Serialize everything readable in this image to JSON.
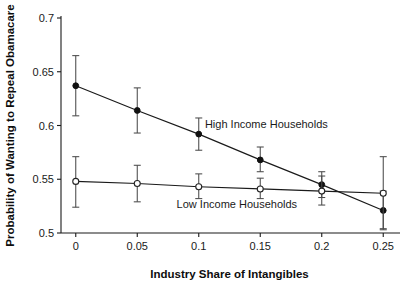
{
  "chart_data": {
    "type": "scatter",
    "title": "",
    "xlabel": "Industry Share of Intangibles",
    "ylabel": "Probability of Wanting to Repeal Obamacare",
    "x": [
      0,
      0.05,
      0.1,
      0.15,
      0.2,
      0.25
    ],
    "xlim": [
      -0.012,
      0.262
    ],
    "ylim": [
      0.5,
      0.7
    ],
    "xticks": [
      0,
      0.05,
      0.1,
      0.15,
      0.2,
      0.25
    ],
    "xtick_labels": [
      "0",
      "0.05",
      "0.1",
      "0.15",
      "0.2",
      "0.25"
    ],
    "yticks": [
      0.5,
      0.55,
      0.6,
      0.65,
      0.7
    ],
    "ytick_labels": [
      "0.5",
      "0.55",
      "0.6",
      "0.65",
      "0.7"
    ],
    "grid": false,
    "legend_position": "inline-annotation",
    "series": [
      {
        "name": "High Income Households",
        "marker": "filled-circle",
        "values": [
          0.637,
          0.614,
          0.592,
          0.568,
          0.545,
          0.521
        ],
        "err_low": [
          0.609,
          0.593,
          0.577,
          0.557,
          0.533,
          0.504
        ],
        "err_high": [
          0.665,
          0.635,
          0.607,
          0.58,
          0.557,
          0.539
        ],
        "annotation": "High Income Households",
        "annotation_x": 0.105,
        "annotation_y": 0.598
      },
      {
        "name": "Low Income Households",
        "marker": "open-circle",
        "values": [
          0.548,
          0.546,
          0.543,
          0.541,
          0.539,
          0.537
        ],
        "err_low": [
          0.524,
          0.529,
          0.532,
          0.532,
          0.526,
          0.503
        ],
        "err_high": [
          0.571,
          0.563,
          0.555,
          0.551,
          0.553,
          0.571
        ],
        "annotation": "Low Income Households",
        "annotation_x": 0.082,
        "annotation_y": 0.523
      }
    ]
  },
  "axes": {
    "x_title": "Industry Share of Intangibles",
    "y_title": "Probability of Wanting to Repeal Obamacare"
  },
  "colors": {
    "axis": "#1a1a1a",
    "series_high": "#111111",
    "series_low": "#222222",
    "errorbar": "#4a4a4a",
    "background": "#ffffff"
  }
}
